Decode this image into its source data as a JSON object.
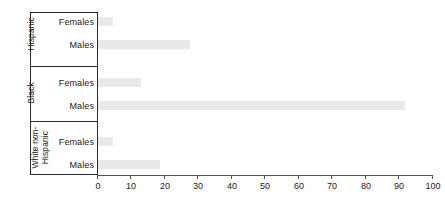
{
  "chart_data": {
    "type": "bar",
    "orientation": "horizontal",
    "title": "",
    "xlabel": "",
    "ylabel": "",
    "xlim": [
      0,
      100
    ],
    "xticks": [
      0,
      10,
      20,
      30,
      40,
      50,
      60,
      70,
      80,
      90,
      100
    ],
    "grid": false,
    "legend": "none",
    "bar_color": "#e9e9e9",
    "axis_color": "#2b2b2b",
    "groups": [
      {
        "name": "Hispanic",
        "series": [
          {
            "label": "Females",
            "value": 4.5
          },
          {
            "label": "Males",
            "value": 27.5
          }
        ]
      },
      {
        "name": "Black",
        "series": [
          {
            "label": "Females",
            "value": 13
          },
          {
            "label": "Males",
            "value": 92
          }
        ]
      },
      {
        "name": "White non-\nHispanic",
        "series": [
          {
            "label": "Females",
            "value": 4.5
          },
          {
            "label": "Males",
            "value": 18.5
          }
        ]
      }
    ],
    "categories": [
      "Hispanic Females",
      "Hispanic Males",
      "Black Females",
      "Black Males",
      "White non-Hispanic Females",
      "White non-Hispanic Males"
    ],
    "values": [
      4.5,
      27.5,
      13,
      92,
      4.5,
      18.5
    ]
  },
  "axis": {
    "tick_labels": [
      "0",
      "10",
      "20",
      "30",
      "40",
      "50",
      "60",
      "70",
      "80",
      "90",
      "100"
    ]
  },
  "labels": {
    "group_0": "Hispanic",
    "group_1": "Black",
    "group_2": "White non-\nHispanic",
    "g0_s0": "Females",
    "g0_s1": "Males",
    "g1_s0": "Females",
    "g1_s1": "Males",
    "g2_s0": "Females",
    "g2_s1": "Males"
  }
}
